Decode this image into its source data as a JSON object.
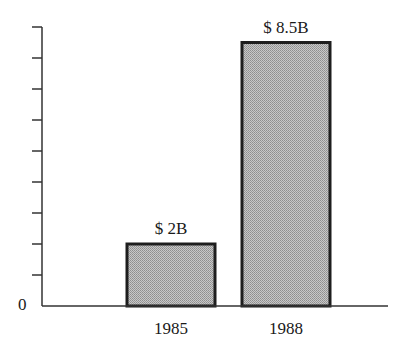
{
  "chart_data": {
    "type": "bar",
    "title": "",
    "xlabel": "",
    "ylabel": "",
    "categories": [
      "1985",
      "1988"
    ],
    "values": [
      2,
      8.5
    ],
    "value_labels": [
      "$ 2B",
      "$ 8.5B"
    ],
    "unit": "billion USD",
    "ylim": [
      0,
      9
    ],
    "y_tick_step": 1,
    "y_tick_labels": [
      "0"
    ],
    "grid": false,
    "legend": null
  },
  "style": {
    "bar_fill": "#b4b4b4",
    "bar_stroke": "#1e1e1e",
    "axis_color": "#333333"
  }
}
